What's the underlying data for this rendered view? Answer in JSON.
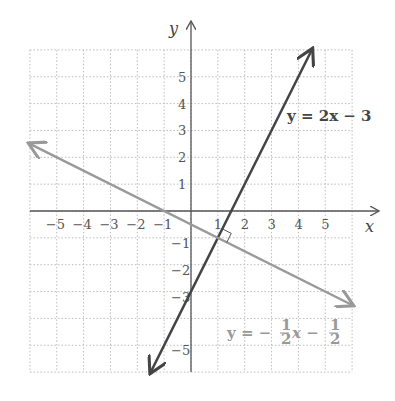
{
  "chart_data": {
    "type": "line",
    "title": "",
    "xlabel": "x",
    "ylabel": "y",
    "xlim": [
      -6,
      6
    ],
    "ylim": [
      -6,
      6
    ],
    "grid": true,
    "x_tick_labels": [
      "-5",
      "-4",
      "-3",
      "-2",
      "-1",
      "1",
      "2",
      "3",
      "4",
      "5"
    ],
    "y_tick_labels": [
      "5",
      "4",
      "3",
      "2",
      "1",
      "-1",
      "-2",
      "-3",
      "-5"
    ],
    "series": [
      {
        "name": "y = 2x − 3",
        "slope": 2,
        "intercept": -3,
        "color": "#444444",
        "x": [
          -1.5,
          4.5
        ],
        "y": [
          -6,
          6
        ]
      },
      {
        "name": "y = −½x − ½",
        "slope": -0.5,
        "intercept": -0.5,
        "color": "#999999",
        "x": [
          -6,
          6
        ],
        "y": [
          2.5,
          -3.5
        ]
      }
    ],
    "annotations": [
      {
        "type": "right-angle-marker",
        "at": [
          1,
          -1
        ],
        "text": "perpendicular"
      },
      {
        "type": "label",
        "text": "y = 2x − 3",
        "position": [
          3.6,
          3.6
        ]
      },
      {
        "type": "label",
        "text": "y = −½x − ½",
        "position": [
          2.5,
          -4.5
        ]
      }
    ]
  },
  "labels": {
    "x_axis": "x",
    "y_axis": "y",
    "eq1": "y = 2x − 3",
    "eq2_prefix": "y = −",
    "eq2_x": "x −",
    "frac_num": "1",
    "frac_den": "2"
  }
}
